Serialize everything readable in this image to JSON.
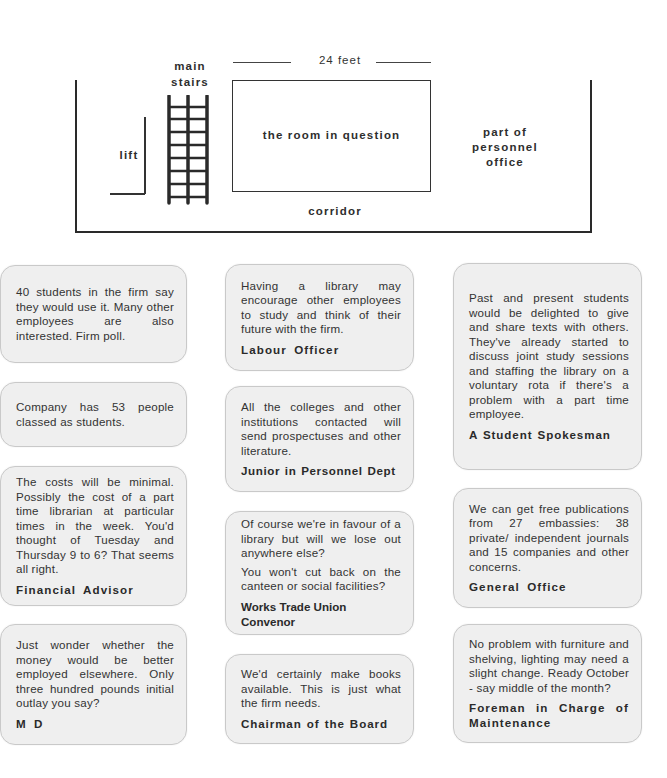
{
  "floor_plan": {
    "dimension_label": "24 feet",
    "labels": {
      "main_stairs": [
        "main",
        "stairs"
      ],
      "lift": "lift",
      "room": "the room in question",
      "personnel_office": [
        "part of",
        "personnel",
        "office"
      ],
      "corridor": "corridor"
    }
  },
  "cards": [
    {
      "id": "firm-poll",
      "text": [
        "40 students in the firm say they would use it.  Many other employees are also interested. Firm poll."
      ],
      "speaker": ""
    },
    {
      "id": "student-count",
      "text": [
        "Company has 53 people classed as students."
      ],
      "speaker": ""
    },
    {
      "id": "financial-advisor",
      "text": [
        "The costs will be minimal. Possibly the cost of a part time librarian at particular times in the week.  You'd thought of Tuesday and Thursday 9 to 6? That seems all right."
      ],
      "speaker": "Financial Advisor"
    },
    {
      "id": "md",
      "text": [
        "Just wonder whether the money would be better employed elsewhere.  Only three hundred pounds initial outlay you say?"
      ],
      "speaker": "M D"
    },
    {
      "id": "labour-officer",
      "text": [
        "Having a library may encourage other employees to study and think of their future with the firm."
      ],
      "speaker": "Labour Officer"
    },
    {
      "id": "junior-personnel",
      "text": [
        "All the colleges and other institutions contacted will send prospectuses and other literature."
      ],
      "speaker": "Junior in Personnel Dept"
    },
    {
      "id": "trade-union",
      "text": [
        "Of course we're in favour of a library but will we lose out anywhere else?",
        "You won't cut back on the canteen or social facilities?"
      ],
      "speaker": "Works Trade Union Convenor"
    },
    {
      "id": "chairman",
      "text": [
        "We'd certainly make books available.  This is just what the firm needs."
      ],
      "speaker": "Chairman of the Board"
    },
    {
      "id": "student-spokesman",
      "text": [
        "Past and present students would be delighted to give and share texts with others. They've already started to discuss joint study sessions and staffing the library on a voluntary rota if there's a problem with a part time employee."
      ],
      "speaker": "A Student Spokesman"
    },
    {
      "id": "general-office",
      "text": [
        "We can get free publications from 27 embassies:  38 private/ independent journals and 15 companies and other concerns."
      ],
      "speaker": "General Office"
    },
    {
      "id": "foreman",
      "text": [
        "No problem with furniture and shelving, lighting may need a slight change.  Ready October - say middle of the month?"
      ],
      "speaker": "Foreman in Charge of Maintenance"
    }
  ],
  "colors": {
    "card_bg": "#efefef",
    "card_border": "#c9c9c9",
    "ink": "#2b2b2b"
  }
}
